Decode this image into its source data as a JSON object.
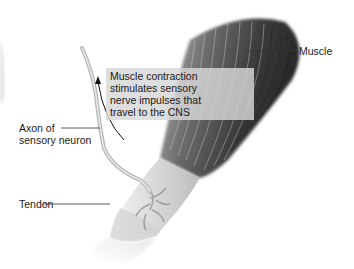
{
  "diagram": {
    "title": "",
    "labels": {
      "muscle": "Muscle",
      "axon_line1": "Axon of",
      "axon_line2": "sensory neuron",
      "tendon": "Tendon"
    },
    "caption": {
      "line1": "Muscle contraction",
      "line2": "stimulates sensory",
      "line3": "nerve impulses that",
      "line4": "travel to the CNS"
    },
    "colors": {
      "background": "#ffffff",
      "muscle_dark": "#2a2a2a",
      "muscle_light": "#9a9a9a",
      "tendon": "#e6e6e6",
      "nerve": "#b5b5b5",
      "caption_box": "#d7d7d7",
      "text": "#1a1a1a"
    }
  }
}
